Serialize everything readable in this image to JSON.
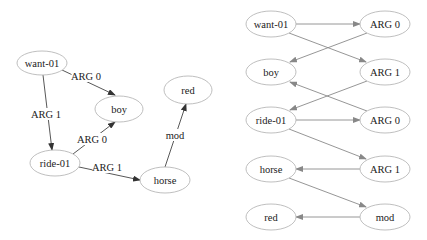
{
  "left_graph": {
    "nodes": [
      {
        "id": "want",
        "label": "want-01",
        "cx": 42,
        "cy": 63,
        "rx": 25,
        "ry": 12
      },
      {
        "id": "boy",
        "label": "boy",
        "cx": 119,
        "cy": 109,
        "rx": 24,
        "ry": 13
      },
      {
        "id": "ride",
        "label": "ride-01",
        "cx": 55,
        "cy": 163,
        "rx": 25,
        "ry": 13
      },
      {
        "id": "horse",
        "label": "horse",
        "cx": 165,
        "cy": 180,
        "rx": 25,
        "ry": 13
      },
      {
        "id": "red",
        "label": "red",
        "cx": 188,
        "cy": 90,
        "rx": 24,
        "ry": 14
      }
    ],
    "edges": [
      {
        "from": "want",
        "to": "boy",
        "label": "ARG 0",
        "x1": 62,
        "y1": 70,
        "x2": 115,
        "y2": 95,
        "lx": 86,
        "ly": 76
      },
      {
        "from": "want",
        "to": "ride",
        "label": "ARG 1",
        "x1": 43,
        "y1": 75,
        "x2": 52,
        "y2": 150,
        "lx": 46,
        "ly": 114
      },
      {
        "from": "ride",
        "to": "boy",
        "label": "ARG 0",
        "x1": 73,
        "y1": 154,
        "x2": 115,
        "y2": 122,
        "lx": 92,
        "ly": 139
      },
      {
        "from": "ride",
        "to": "horse",
        "label": "ARG 1",
        "x1": 79,
        "y1": 167,
        "x2": 140,
        "y2": 180,
        "lx": 107,
        "ly": 167
      },
      {
        "from": "horse",
        "to": "red",
        "label": "mod",
        "x1": 165,
        "y1": 167,
        "x2": 186,
        "y2": 104,
        "lx": 175,
        "ly": 135
      }
    ]
  },
  "right_graph": {
    "nodes": [
      {
        "id": "r_want",
        "label": "want-01",
        "cx": 271,
        "cy": 24,
        "rx": 25,
        "ry": 13
      },
      {
        "id": "r_arg0a",
        "label": "ARG 0",
        "cx": 385,
        "cy": 24,
        "rx": 25,
        "ry": 13
      },
      {
        "id": "r_boy",
        "label": "boy",
        "cx": 271,
        "cy": 72,
        "rx": 25,
        "ry": 13
      },
      {
        "id": "r_arg1a",
        "label": "ARG 1",
        "cx": 385,
        "cy": 72,
        "rx": 25,
        "ry": 13
      },
      {
        "id": "r_ride",
        "label": "ride-01",
        "cx": 271,
        "cy": 120,
        "rx": 25,
        "ry": 13
      },
      {
        "id": "r_arg0b",
        "label": "ARG 0",
        "cx": 385,
        "cy": 120,
        "rx": 25,
        "ry": 13
      },
      {
        "id": "r_horse",
        "label": "horse",
        "cx": 271,
        "cy": 169,
        "rx": 25,
        "ry": 13
      },
      {
        "id": "r_arg1b",
        "label": "ARG 1",
        "cx": 385,
        "cy": 169,
        "rx": 25,
        "ry": 13
      },
      {
        "id": "r_red",
        "label": "red",
        "cx": 271,
        "cy": 217,
        "rx": 25,
        "ry": 13
      },
      {
        "id": "r_mod",
        "label": "mod",
        "cx": 385,
        "cy": 217,
        "rx": 25,
        "ry": 13
      }
    ],
    "edges": [
      {
        "from": "r_want",
        "to": "r_arg0a",
        "x1": 296,
        "y1": 24,
        "x2": 360,
        "y2": 24
      },
      {
        "from": "r_want",
        "to": "r_arg1a",
        "x1": 289,
        "y1": 33,
        "x2": 366,
        "y2": 62
      },
      {
        "from": "r_arg0a",
        "to": "r_boy",
        "x1": 367,
        "y1": 33,
        "x2": 290,
        "y2": 62
      },
      {
        "from": "r_arg1a",
        "to": "r_ride",
        "x1": 367,
        "y1": 81,
        "x2": 290,
        "y2": 110
      },
      {
        "from": "r_arg0b",
        "to": "r_boy",
        "x1": 367,
        "y1": 111,
        "x2": 290,
        "y2": 82
      },
      {
        "from": "r_ride",
        "to": "r_arg0b",
        "x1": 296,
        "y1": 120,
        "x2": 360,
        "y2": 120
      },
      {
        "from": "r_ride",
        "to": "r_arg1b",
        "x1": 289,
        "y1": 129,
        "x2": 366,
        "y2": 159
      },
      {
        "from": "r_arg1b",
        "to": "r_horse",
        "x1": 360,
        "y1": 169,
        "x2": 296,
        "y2": 169
      },
      {
        "from": "r_horse",
        "to": "r_mod",
        "x1": 289,
        "y1": 178,
        "x2": 366,
        "y2": 207
      },
      {
        "from": "r_mod",
        "to": "r_red",
        "x1": 360,
        "y1": 217,
        "x2": 296,
        "y2": 217
      }
    ]
  }
}
